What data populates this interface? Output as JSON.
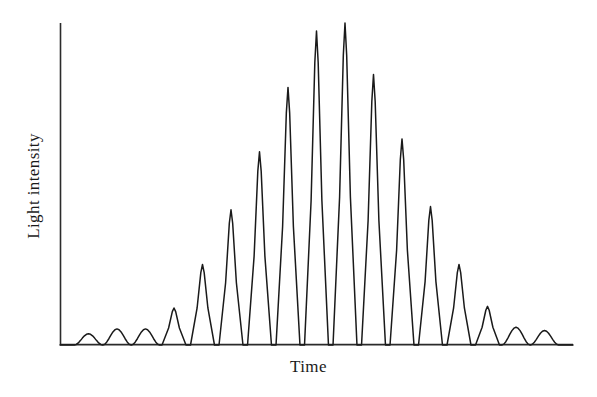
{
  "figure": {
    "title": "",
    "background_color": "#ffffff",
    "line_color": "#1a1a1a",
    "axis_color": "#2b2b2b"
  },
  "axes": {
    "ylabel": "Light intensity",
    "xlabel": "Time",
    "x_axis_pixels": {
      "x_start": 60,
      "x_end": 573,
      "y": 345
    },
    "y_axis_pixels": {
      "x": 60,
      "y_start": 23,
      "y_end": 345
    }
  },
  "chart_data": {
    "type": "line",
    "title": "",
    "xlabel": "Time",
    "ylabel": "Light intensity",
    "xlim": [
      0,
      18
    ],
    "ylim": [
      0,
      1
    ],
    "grid": false,
    "legend": null,
    "ticks": {
      "x": [],
      "y": []
    },
    "peaks": [
      {
        "index": 1,
        "x": 1.0,
        "height": 0.035
      },
      {
        "index": 2,
        "x": 2.0,
        "height": 0.05
      },
      {
        "index": 3,
        "x": 3.0,
        "height": 0.05
      },
      {
        "index": 4,
        "x": 4.0,
        "height": 0.115
      },
      {
        "index": 5,
        "x": 5.0,
        "height": 0.25
      },
      {
        "index": 6,
        "x": 6.0,
        "height": 0.42
      },
      {
        "index": 7,
        "x": 7.0,
        "height": 0.6
      },
      {
        "index": 8,
        "x": 8.0,
        "height": 0.8
      },
      {
        "index": 9,
        "x": 9.0,
        "height": 0.975
      },
      {
        "index": 10,
        "x": 10.0,
        "height": 1.0
      },
      {
        "index": 11,
        "x": 11.0,
        "height": 0.84
      },
      {
        "index": 12,
        "x": 12.0,
        "height": 0.64
      },
      {
        "index": 13,
        "x": 13.0,
        "height": 0.43
      },
      {
        "index": 14,
        "x": 14.0,
        "height": 0.25
      },
      {
        "index": 15,
        "x": 15.0,
        "height": 0.12
      },
      {
        "index": 16,
        "x": 16.0,
        "height": 0.055
      },
      {
        "index": 17,
        "x": 17.0,
        "height": 0.045
      }
    ],
    "minima_at_baseline": true,
    "peak_count": 17
  }
}
